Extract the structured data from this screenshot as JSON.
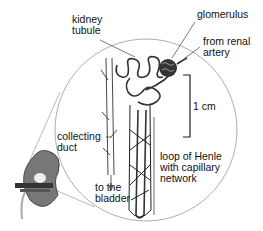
{
  "diagram": {
    "labels": {
      "kidney_tubule": "kidney\ntubule",
      "glomerulus": "glomerulus",
      "from_renal_artery": "from renal\nartery",
      "scale": "1 cm",
      "collecting_duct": "collecting\nduct",
      "to_the_bladder": "to the\nbladder",
      "loop_of_henle": "loop of Henle\nwith capillary\nnetwork"
    },
    "colors": {
      "line": "#222222",
      "circle": "#888888",
      "glomerulus_fill": "#333333",
      "kidney_fill": "#6a6a6a"
    }
  }
}
